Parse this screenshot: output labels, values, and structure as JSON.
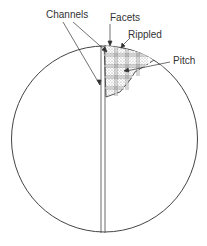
{
  "diagram": {
    "labels": {
      "channels": "Channels",
      "facets": "Facets",
      "rippled": "Rippled",
      "pitch": "Pitch"
    },
    "colors": {
      "stroke": "#333333",
      "fill_stipple": "#bbbbbb",
      "background": "#ffffff"
    }
  }
}
